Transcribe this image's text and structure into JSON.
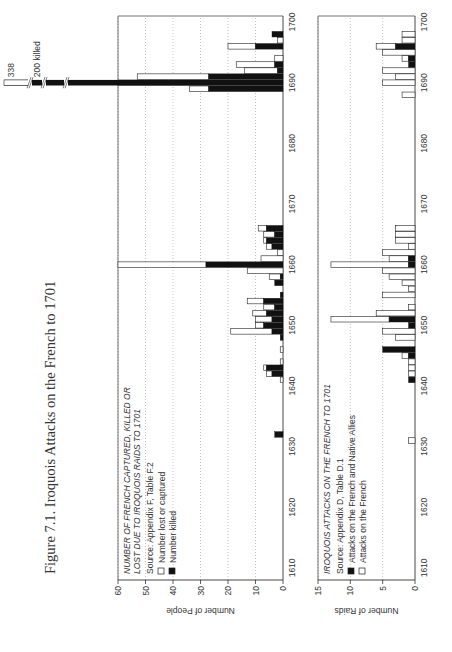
{
  "figure": {
    "title": "Figure 7.1. Iroquois Attacks on the French to 1701"
  },
  "chart_data": [
    {
      "type": "bar",
      "stacked": true,
      "title": "NUMBER OF FRENCH CAPTURED, KILLED OR LOST DUE TO IROQUOIS RAIDS TO 1701",
      "source": "Source: Appendix F, Table F.2",
      "xlabel": "",
      "ylabel": "Number of People",
      "xlim": [
        1608,
        1701
      ],
      "ylim": [
        0,
        60
      ],
      "yticks": [
        0,
        10,
        20,
        30,
        40,
        50,
        60
      ],
      "xticks": [
        1610,
        1620,
        1630,
        1640,
        1650,
        1660,
        1670,
        1680,
        1690,
        1700
      ],
      "grid": "horizontal dotted",
      "legend": [
        {
          "label": "Number lost or captured",
          "fill": "#ffffff"
        },
        {
          "label": "Number killed",
          "fill": "#111111"
        }
      ],
      "annotations": [
        "338",
        "200 killed"
      ],
      "x": [
        1632,
        1641,
        1642,
        1643,
        1644,
        1646,
        1648,
        1649,
        1650,
        1651,
        1652,
        1653,
        1654,
        1655,
        1657,
        1658,
        1659,
        1660,
        1661,
        1662,
        1663,
        1664,
        1665,
        1666,
        1689,
        1690,
        1691,
        1692,
        1693,
        1694,
        1695,
        1696,
        1697,
        1698
      ],
      "series": [
        {
          "name": "Number killed",
          "values": [
            3,
            0,
            4,
            6,
            0,
            0,
            1,
            4,
            7,
            4,
            6,
            3,
            7,
            1,
            3,
            1,
            0,
            28,
            0,
            0,
            4,
            6,
            3,
            6,
            27,
            60,
            27,
            2,
            3,
            0,
            0,
            10,
            0,
            4
          ]
        },
        {
          "name": "Number lost or captured",
          "values": [
            0,
            1,
            2,
            1,
            1,
            1,
            0,
            15,
            3,
            6,
            5,
            4,
            6,
            0,
            0,
            4,
            13,
            34,
            8,
            2,
            2,
            1,
            4,
            3,
            7,
            338,
            26,
            12,
            14,
            3,
            0,
            10,
            2,
            0
          ]
        }
      ],
      "broken_bar_note": {
        "year": 1690,
        "killed": 200,
        "total": 338
      }
    },
    {
      "type": "bar",
      "stacked": true,
      "title": "IROQUOIS ATTACKS ON THE FRENCH TO 1701",
      "source": "Source: Appendix D, Table D.1",
      "xlabel": "",
      "ylabel": "Number of Raids",
      "xlim": [
        1608,
        1701
      ],
      "ylim": [
        0,
        15
      ],
      "yticks": [
        0,
        5,
        10,
        15
      ],
      "xticks": [
        1610,
        1620,
        1630,
        1640,
        1650,
        1660,
        1670,
        1680,
        1690,
        1700
      ],
      "grid": "horizontal dotted",
      "legend": [
        {
          "label": "Attacks on the French and Native Allies",
          "fill": "#111111"
        },
        {
          "label": "Attacks on the French",
          "fill": "#ffffff"
        }
      ],
      "x": [
        1631,
        1641,
        1642,
        1643,
        1644,
        1645,
        1646,
        1648,
        1649,
        1650,
        1651,
        1652,
        1653,
        1655,
        1656,
        1657,
        1658,
        1659,
        1660,
        1661,
        1662,
        1663,
        1664,
        1665,
        1666,
        1688,
        1690,
        1691,
        1692,
        1693,
        1694,
        1695,
        1696,
        1697,
        1698
      ],
      "series": [
        {
          "name": "Attacks on the French",
          "values": [
            1,
            0,
            1,
            1,
            1,
            1,
            0,
            3,
            5,
            0,
            9,
            6,
            1,
            5,
            1,
            2,
            4,
            5,
            12,
            3,
            5,
            1,
            3,
            3,
            3,
            2,
            5,
            3,
            5,
            0,
            1,
            5,
            3,
            2,
            2
          ]
        },
        {
          "name": "Attacks on the French and Native Allies",
          "values": [
            0,
            1,
            0,
            0,
            0,
            1,
            5,
            0,
            0,
            1,
            4,
            0,
            0,
            0,
            0,
            0,
            0,
            0,
            1,
            1,
            0,
            0,
            0,
            0,
            0,
            0,
            0,
            0,
            0,
            1,
            1,
            0,
            3,
            0,
            0
          ]
        }
      ]
    }
  ]
}
